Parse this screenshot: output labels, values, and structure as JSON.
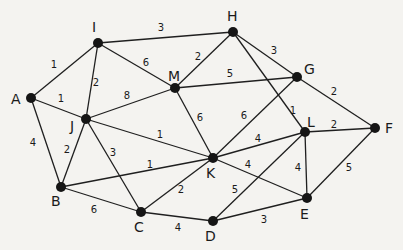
{
  "diagram": {
    "type": "weighted-undirected-graph",
    "nodes": [
      {
        "id": "A",
        "x": 31,
        "y": 98,
        "lx": 11,
        "ly": 104
      },
      {
        "id": "I",
        "x": 98,
        "y": 43,
        "lx": 92,
        "ly": 32
      },
      {
        "id": "H",
        "x": 233,
        "y": 32,
        "lx": 227,
        "ly": 21
      },
      {
        "id": "M",
        "x": 175,
        "y": 88,
        "lx": 168,
        "ly": 81
      },
      {
        "id": "G",
        "x": 297,
        "y": 77,
        "lx": 304,
        "ly": 74
      },
      {
        "id": "J",
        "x": 86,
        "y": 119,
        "lx": 70,
        "ly": 131
      },
      {
        "id": "L",
        "x": 305,
        "y": 132,
        "lx": 307,
        "ly": 127
      },
      {
        "id": "F",
        "x": 375,
        "y": 128,
        "lx": 385,
        "ly": 133
      },
      {
        "id": "K",
        "x": 213,
        "y": 158,
        "lx": 206,
        "ly": 178
      },
      {
        "id": "B",
        "x": 61,
        "y": 187,
        "lx": 51,
        "ly": 206
      },
      {
        "id": "C",
        "x": 141,
        "y": 212,
        "lx": 134,
        "ly": 232
      },
      {
        "id": "D",
        "x": 213,
        "y": 221,
        "lx": 205,
        "ly": 241
      },
      {
        "id": "E",
        "x": 307,
        "y": 198,
        "lx": 300,
        "ly": 219
      }
    ],
    "edges": [
      {
        "from": "A",
        "to": "I",
        "w": "1",
        "wx": 54,
        "wy": 68
      },
      {
        "from": "A",
        "to": "J",
        "w": "1",
        "wx": 61,
        "wy": 102
      },
      {
        "from": "A",
        "to": "B",
        "w": "4",
        "wx": 33,
        "wy": 146
      },
      {
        "from": "I",
        "to": "H",
        "w": "3",
        "wx": 161,
        "wy": 31
      },
      {
        "from": "I",
        "to": "M",
        "w": "6",
        "wx": 146,
        "wy": 66
      },
      {
        "from": "I",
        "to": "J",
        "w": "2",
        "wx": 96,
        "wy": 86
      },
      {
        "from": "H",
        "to": "M",
        "w": "2",
        "wx": 198,
        "wy": 60
      },
      {
        "from": "H",
        "to": "G",
        "w": "3",
        "wx": 274,
        "wy": 54
      },
      {
        "from": "H",
        "to": "L",
        "w": "1",
        "wx": 293,
        "wy": 114
      },
      {
        "from": "M",
        "to": "J",
        "w": "8",
        "wx": 127,
        "wy": 99
      },
      {
        "from": "M",
        "to": "G",
        "w": "5",
        "wx": 230,
        "wy": 77
      },
      {
        "from": "M",
        "to": "K",
        "w": "6",
        "wx": 200,
        "wy": 121
      },
      {
        "from": "G",
        "to": "K",
        "w": "6",
        "wx": 244,
        "wy": 119
      },
      {
        "from": "G",
        "to": "F",
        "w": "2",
        "wx": 334,
        "wy": 95
      },
      {
        "from": "J",
        "to": "K",
        "w": "1",
        "wx": 160,
        "wy": 138
      },
      {
        "from": "J",
        "to": "B",
        "w": "2",
        "wx": 67,
        "wy": 153
      },
      {
        "from": "J",
        "to": "C",
        "w": "3",
        "wx": 113,
        "wy": 156
      },
      {
        "from": "B",
        "to": "K",
        "w": "1",
        "wx": 150,
        "wy": 168
      },
      {
        "from": "B",
        "to": "C",
        "w": "6",
        "wx": 94,
        "wy": 213
      },
      {
        "from": "C",
        "to": "K",
        "w": "2",
        "wx": 181,
        "wy": 193
      },
      {
        "from": "C",
        "to": "D",
        "w": "4",
        "wx": 178,
        "wy": 231
      },
      {
        "from": "K",
        "to": "L",
        "w": "4",
        "wx": 258,
        "wy": 142
      },
      {
        "from": "K",
        "to": "E",
        "w": "4",
        "wx": 248,
        "wy": 168
      },
      {
        "from": "D",
        "to": "L",
        "w": "5",
        "wx": 235,
        "wy": 193
      },
      {
        "from": "D",
        "to": "E",
        "w": "3",
        "wx": 264,
        "wy": 223
      },
      {
        "from": "L",
        "to": "F",
        "w": "2",
        "wx": 334,
        "wy": 128
      },
      {
        "from": "L",
        "to": "E",
        "w": "4",
        "wx": 298,
        "wy": 171
      },
      {
        "from": "E",
        "to": "F",
        "w": "5",
        "wx": 349,
        "wy": 171
      }
    ]
  },
  "colors": {
    "background": "#f4f3f0",
    "stroke": "#1f1f1f",
    "node_fill": "#151515"
  }
}
